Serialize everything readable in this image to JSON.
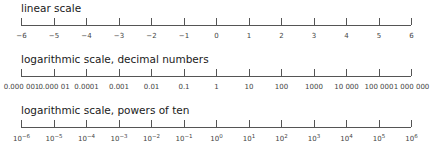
{
  "scales": [
    {
      "title": "linear scale",
      "labels": [
        "−6",
        "−5",
        "−4",
        "−3",
        "−2",
        "−1",
        "0",
        "1",
        "2",
        "3",
        "4",
        "5",
        "6"
      ]
    },
    {
      "title": "logarithmic scale, decimal numbers",
      "labels": [
        "0.000 001",
        "0.000 01",
        "0.0001",
        "0.001",
        "0.01",
        "0.1",
        "1",
        "10",
        "100",
        "1000",
        "10 000",
        "100 000",
        "1 000 000"
      ]
    },
    {
      "title": "logarithmic scale, powers of ten",
      "labels": [
        "10",
        "10",
        "10",
        "10",
        "10",
        "10",
        "10",
        "10",
        "10",
        "10",
        "10",
        "10",
        "10"
      ],
      "exponents": [
        "−6",
        "−5",
        "−4",
        "−3",
        "−2",
        "−1",
        "0",
        "1",
        "2",
        "3",
        "4",
        "5",
        "6"
      ]
    }
  ],
  "colors": {
    "axis": "#555555",
    "text": "#444444"
  }
}
